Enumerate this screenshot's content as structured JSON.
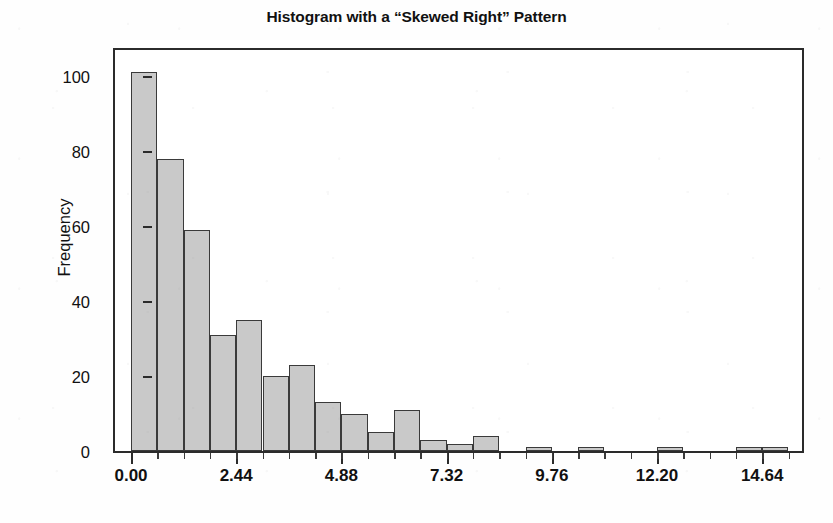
{
  "chart_data": {
    "type": "bar",
    "title": "Histogram with a “Skewed Right” Pattern",
    "xlabel": "",
    "ylabel": "Frequency",
    "grid": false,
    "legend": null,
    "bin_width": 0.61,
    "xlim": [
      -0.3,
      16.0
    ],
    "ylim": [
      0,
      108
    ],
    "xticks": [
      "0.00",
      "2.44",
      "4.88",
      "7.32",
      "9.76",
      "12.20",
      "14.64"
    ],
    "xtick_values": [
      0.0,
      2.44,
      4.88,
      7.32,
      9.76,
      12.2,
      14.64
    ],
    "yticks": [
      "0",
      "20",
      "40",
      "60",
      "80",
      "100"
    ],
    "ytick_values": [
      0,
      20,
      40,
      60,
      80,
      100
    ],
    "bins": [
      {
        "x0": 0.0,
        "x1": 0.61,
        "value": 101
      },
      {
        "x0": 0.61,
        "x1": 1.22,
        "value": 78
      },
      {
        "x0": 1.22,
        "x1": 1.83,
        "value": 59
      },
      {
        "x0": 1.83,
        "x1": 2.44,
        "value": 31
      },
      {
        "x0": 2.44,
        "x1": 3.05,
        "value": 35
      },
      {
        "x0": 3.05,
        "x1": 3.66,
        "value": 20
      },
      {
        "x0": 3.66,
        "x1": 4.27,
        "value": 23
      },
      {
        "x0": 4.27,
        "x1": 4.88,
        "value": 13
      },
      {
        "x0": 4.88,
        "x1": 5.49,
        "value": 10
      },
      {
        "x0": 5.49,
        "x1": 6.1,
        "value": 5
      },
      {
        "x0": 6.1,
        "x1": 6.71,
        "value": 11
      },
      {
        "x0": 6.71,
        "x1": 7.32,
        "value": 3
      },
      {
        "x0": 7.32,
        "x1": 7.93,
        "value": 2
      },
      {
        "x0": 7.93,
        "x1": 8.54,
        "value": 4
      },
      {
        "x0": 8.54,
        "x1": 9.15,
        "value": 0
      },
      {
        "x0": 9.15,
        "x1": 9.76,
        "value": 1
      },
      {
        "x0": 9.76,
        "x1": 10.37,
        "value": 0
      },
      {
        "x0": 10.37,
        "x1": 10.98,
        "value": 1
      },
      {
        "x0": 10.98,
        "x1": 11.59,
        "value": 0
      },
      {
        "x0": 11.59,
        "x1": 12.2,
        "value": 0
      },
      {
        "x0": 12.2,
        "x1": 12.81,
        "value": 1
      },
      {
        "x0": 12.81,
        "x1": 13.42,
        "value": 0
      },
      {
        "x0": 13.42,
        "x1": 14.03,
        "value": 0
      },
      {
        "x0": 14.03,
        "x1": 14.64,
        "value": 1
      },
      {
        "x0": 14.64,
        "x1": 15.25,
        "value": 1
      }
    ],
    "colors": {
      "bar_fill": "#c9c9c9",
      "bar_border": "#3a3a3a",
      "axis": "#2b2b2b",
      "text": "#111111",
      "background": "#ffffff"
    }
  }
}
